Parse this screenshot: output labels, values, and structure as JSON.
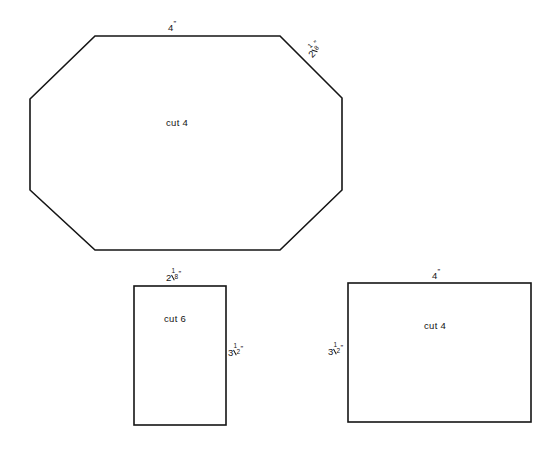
{
  "document": {
    "title": "Pattern Piece Cutting Diagram",
    "background_color": "#ffffff",
    "line_color": "#151515",
    "text_color": "#141414"
  },
  "pieces": [
    {
      "id": "octagon",
      "shape": "octagon",
      "cut_label": "cut 4",
      "cut_quantity": 4,
      "dimensions": [
        {
          "id": "octagon-top-width",
          "whole": "4",
          "numerator": "",
          "denominator": "",
          "unit": "”",
          "text": "4”",
          "edge": "top"
        },
        {
          "id": "octagon-diagonal",
          "whole": "2",
          "numerator": "1",
          "denominator": "8",
          "unit": "”",
          "text": "2⅛”",
          "edge": "upper-right-diagonal"
        }
      ]
    },
    {
      "id": "small-rectangle",
      "shape": "rectangle",
      "cut_label": "cut 6",
      "cut_quantity": 6,
      "dimensions": [
        {
          "id": "small-rect-width",
          "whole": "2",
          "numerator": "1",
          "denominator": "8",
          "unit": "”",
          "text": "2⅛”",
          "edge": "top"
        },
        {
          "id": "small-rect-height",
          "whole": "3",
          "numerator": "1",
          "denominator": "2",
          "unit": "”",
          "text": "3½”",
          "edge": "right"
        }
      ]
    },
    {
      "id": "large-rectangle",
      "shape": "rectangle",
      "cut_label": "cut 4",
      "cut_quantity": 4,
      "dimensions": [
        {
          "id": "large-rect-width",
          "whole": "4",
          "numerator": "",
          "denominator": "",
          "unit": "”",
          "text": "4”",
          "edge": "top"
        },
        {
          "id": "large-rect-height",
          "whole": "3",
          "numerator": "1",
          "denominator": "2",
          "unit": "”",
          "text": "3½”",
          "edge": "left"
        }
      ]
    }
  ]
}
